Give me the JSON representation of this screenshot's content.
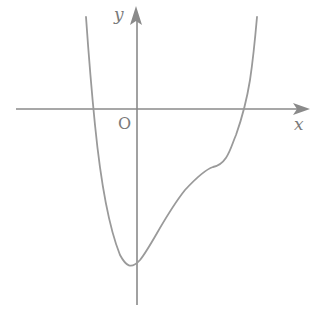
{
  "figure": {
    "type": "function-graph",
    "axes": {
      "x_label": "x",
      "y_label": "y",
      "origin_label": "O"
    },
    "colors": {
      "axis": "#8a8a8a",
      "curve": "#9a9a9a",
      "label": "#7a7a7a",
      "background": "#ffffff"
    },
    "curve": {
      "description": "Quartic-like function: crosses x-axis left of origin, minimum slightly left of y-axis below origin, inflection plateau on right, then rises to cross x-axis on right",
      "features": {
        "left_x_intercept": "negative x",
        "minimum": "near x slightly < 0, y very negative",
        "inflection_flat_region": "positive x, y negative",
        "right_x_intercept": "positive x"
      }
    }
  }
}
